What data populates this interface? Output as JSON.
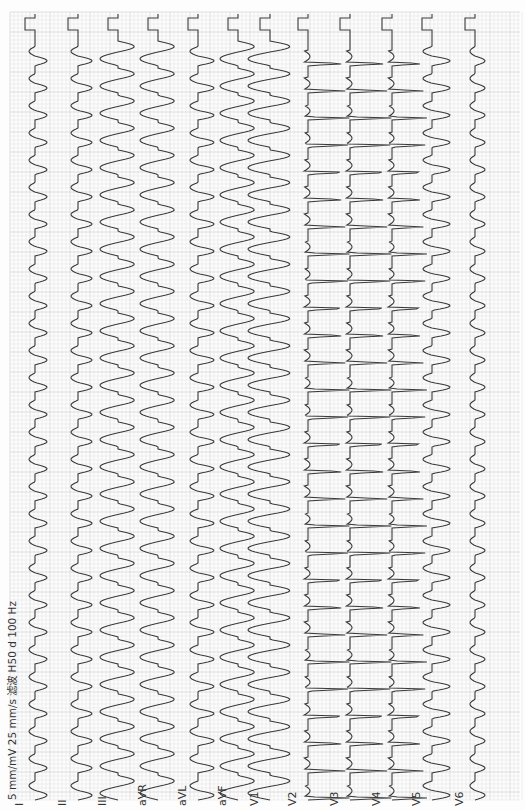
{
  "header": {
    "settings_text": "5 mm/mV 25 mm/s 滤波 H50 d 100 Hz"
  },
  "colors": {
    "trace": "#3a3a3a",
    "grid_minor": "#e6e6e6",
    "grid_major": "#cfcfcf",
    "background": "#fdfdfd"
  },
  "chart_data": {
    "type": "line",
    "orientation": "vertical",
    "gain": "5 mm/mV",
    "paper_speed": "25 mm/s",
    "filter": "H50 d 100 Hz",
    "grid": true,
    "beat_period_px": 27.2,
    "beats_visible": 29,
    "leads": [
      {
        "name": "I",
        "x": 35,
        "amp": 12,
        "shape": "pos"
      },
      {
        "name": "II",
        "x": 78,
        "amp": 14,
        "shape": "pos"
      },
      {
        "name": "III",
        "x": 118,
        "amp": 18,
        "shape": "wide"
      },
      {
        "name": "aVR",
        "x": 158,
        "amp": 18,
        "shape": "wide"
      },
      {
        "name": "aVL",
        "x": 198,
        "amp": 16,
        "shape": "pos"
      },
      {
        "name": "aVF",
        "x": 238,
        "amp": 18,
        "shape": "wide"
      },
      {
        "name": "V1",
        "x": 270,
        "amp": 22,
        "shape": "wide"
      },
      {
        "name": "V2",
        "x": 308,
        "amp": 45,
        "shape": "deep"
      },
      {
        "name": "V3",
        "x": 350,
        "amp": 45,
        "shape": "deep"
      },
      {
        "name": "V4",
        "x": 392,
        "amp": 38,
        "shape": "deep"
      },
      {
        "name": "V5",
        "x": 432,
        "amp": 18,
        "shape": "pos"
      },
      {
        "name": "V6",
        "x": 475,
        "amp": 10,
        "shape": "pos"
      }
    ]
  }
}
